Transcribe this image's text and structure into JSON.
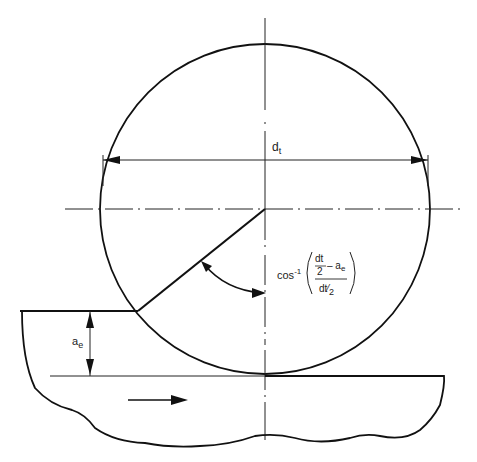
{
  "diagram": {
    "labels": {
      "diameter": "d",
      "diameter_sub": "t",
      "depth": "a",
      "depth_sub": "e",
      "angle_func": "cos",
      "angle_exp": "-1",
      "frac_num_top": "dt",
      "frac_num_bottom": "2",
      "frac_num_minus": "– a",
      "frac_num_minus_sub": "e",
      "frac_den": "dt",
      "frac_den_div": "⁄",
      "frac_den_2": "2"
    },
    "geometry": {
      "circle_center": [
        265,
        209
      ],
      "circle_radius": 165,
      "workpiece_top_left_y": 311,
      "workpiece_surface_y": 376,
      "feed_direction": "right"
    },
    "colors": {
      "stroke": "#111111",
      "background": "#ffffff"
    }
  }
}
